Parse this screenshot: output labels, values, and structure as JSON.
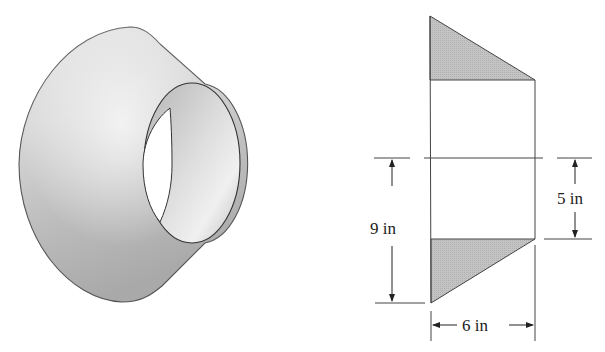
{
  "figure": {
    "left_view": {
      "description": "3D rendering of a truncated cone (frustum) with a cylindrical bore through its center",
      "fill_colors": {
        "outer_surface": "#c8c8c8",
        "outer_highlight": "#eeeeee",
        "inner_bore": "#d6d6d6",
        "hole": "#ffffff",
        "outline": "#555555"
      }
    },
    "right_view": {
      "description": "Cross-section of the bored frustum with shaded triangular regions rotated about the center axis",
      "shaded_fill": "#bdbdbd",
      "outline": "#444444"
    },
    "dimensions": {
      "overall_height_label": "9 in",
      "bore_half_height_label": "5 in",
      "width_label": "6 in"
    }
  }
}
